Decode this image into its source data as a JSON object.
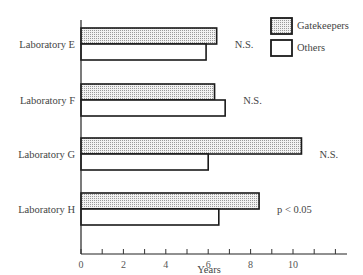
{
  "chart_data": {
    "type": "bar",
    "orientation": "horizontal",
    "title": "",
    "xlabel": "Years",
    "ylabel": "",
    "xlim": [
      0,
      12.5
    ],
    "x_ticks": [
      0,
      1,
      2,
      3,
      4,
      5,
      6,
      7,
      8,
      9,
      10,
      11,
      12
    ],
    "x_tick_labels": [
      "0",
      "2",
      "4",
      "6",
      "8",
      "10"
    ],
    "grid": false,
    "legend_position": "top-right",
    "categories": [
      "Laboratory E",
      "Laboratory F",
      "Laboratory G",
      "Laboratory H"
    ],
    "series": [
      {
        "name": "Gatekeepers",
        "fill": "dotted",
        "values": [
          6.4,
          6.3,
          10.4,
          8.4
        ]
      },
      {
        "name": "Others",
        "fill": "white",
        "values": [
          5.9,
          6.8,
          6.0,
          6.5
        ]
      }
    ],
    "annotations": [
      "N.S.",
      "N.S.",
      "N.S.",
      "p < 0.05"
    ]
  },
  "legend": {
    "items": [
      {
        "label": "Gatekeepers",
        "fill": "dotted"
      },
      {
        "label": "Others",
        "fill": "white"
      }
    ]
  },
  "colors": {
    "stroke": "#1a1a1a",
    "dot": "#9a9a9a",
    "text": "#444444"
  }
}
